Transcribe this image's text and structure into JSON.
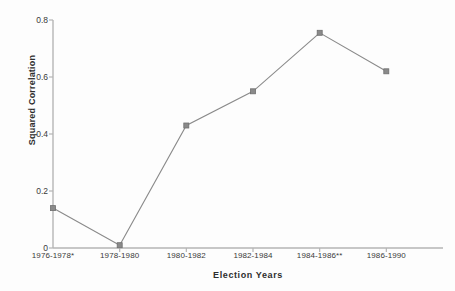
{
  "chart_data": {
    "type": "line",
    "title": "",
    "xlabel": "Election Years",
    "ylabel": "Squared Correlation",
    "categories": [
      "1976-1978*",
      "1978-1980",
      "1980-1982",
      "1982-1984",
      "1984-1986**",
      "1986-1990"
    ],
    "values": [
      0.14,
      0.01,
      0.43,
      0.55,
      0.755,
      0.62
    ],
    "series": [
      {
        "name": "Squared Correlation",
        "values": [
          0.14,
          0.01,
          0.43,
          0.55,
          0.755,
          0.62
        ]
      }
    ],
    "ylim": [
      0,
      0.8
    ],
    "yticks": [
      0,
      0.2,
      0.4,
      0.6,
      0.8
    ],
    "ytick_labels": [
      "0",
      "0.2",
      "0.4",
      "0.6",
      "0.8"
    ],
    "grid": false,
    "legend": "none",
    "marker": "square",
    "line_color": "#8a8a8a",
    "marker_color": "#8a8a8a",
    "axis_color": "#b5b5b5",
    "text_color": "#3a3a3a"
  }
}
